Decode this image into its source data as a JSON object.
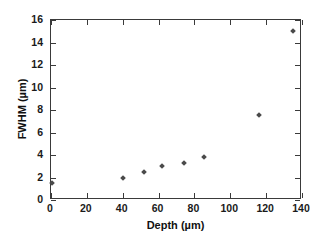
{
  "chart_data": {
    "type": "scatter",
    "title": "",
    "xlabel": "Depth (µm)",
    "ylabel": "FWHM (µm)",
    "xlim": [
      0,
      140
    ],
    "ylim": [
      0,
      16
    ],
    "xticks": [
      0,
      20,
      40,
      60,
      80,
      100,
      120,
      140
    ],
    "yticks": [
      0,
      2,
      4,
      6,
      8,
      10,
      12,
      14,
      16
    ],
    "xtick_labels": [
      "0",
      "20",
      "40",
      "60",
      "80",
      "100",
      "120",
      "140"
    ],
    "ytick_labels": [
      "0",
      "2",
      "4",
      "6",
      "8",
      "10",
      "12",
      "14",
      "16"
    ],
    "grid": false,
    "legend": null,
    "marker": "diamond",
    "marker_color": "#4a4a4a",
    "frame_color": "#3a3a3a",
    "background": "#ffffff",
    "x": [
      0.5,
      40,
      52,
      62,
      74,
      85.5,
      116,
      135
    ],
    "y": [
      1.5,
      2.0,
      2.45,
      3.0,
      3.3,
      3.85,
      7.6,
      15.0
    ],
    "points": [
      {
        "x": 0.5,
        "y": 1.5
      },
      {
        "x": 40,
        "y": 2.0
      },
      {
        "x": 52,
        "y": 2.45
      },
      {
        "x": 62,
        "y": 3.0
      },
      {
        "x": 74,
        "y": 3.3
      },
      {
        "x": 85.5,
        "y": 3.85
      },
      {
        "x": 116,
        "y": 7.6
      },
      {
        "x": 135,
        "y": 15.0
      }
    ]
  }
}
